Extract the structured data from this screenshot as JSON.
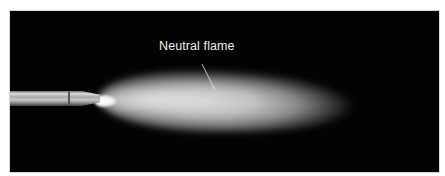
{
  "figure": {
    "background_color": "#030303",
    "frame_color": "#ffffff",
    "annotations": [
      {
        "label": "Neutral flame",
        "points_to": "flame-body"
      }
    ]
  }
}
